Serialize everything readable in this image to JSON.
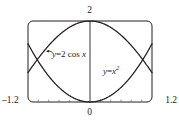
{
  "figure": {
    "name": "graphing-window-figure",
    "background_color": "#ffffff",
    "stroke_color": "#231f20",
    "frame": {
      "x_left_px": 28,
      "y_top_px": 21,
      "x_right_px": 152,
      "y_bottom_px": 102,
      "corner_radius_px": 5
    }
  },
  "labels": {
    "y_max": "2",
    "origin": "0",
    "x_min": "–1.2",
    "x_max": "1.2"
  },
  "curves": {
    "cosine": {
      "label_y": "y",
      "label_eq": "=",
      "label_coef": "2",
      "label_fn": "cos",
      "label_var": "x",
      "full_label": "y = 2 cos x",
      "color": "#231f20"
    },
    "parabola": {
      "label_y": "y",
      "label_eq": "=",
      "label_var": "x",
      "label_exp": "2",
      "full_label": "y = x²",
      "color": "#231f20"
    }
  },
  "chart_data": {
    "type": "line",
    "title": "",
    "xlabel": "",
    "ylabel": "",
    "xlim": [
      -1.2,
      1.2
    ],
    "ylim": [
      0,
      2
    ],
    "grid": false,
    "legend_position": "inline-annotations",
    "tick_labels": {
      "x": [
        "-1.2",
        "0",
        "1.2"
      ],
      "y": [
        "0",
        "2"
      ]
    },
    "annotations": [
      {
        "text": "y = 2 cos x",
        "x": -0.45,
        "y": 1.22,
        "leader_to_x": -0.83,
        "leader_to_y": 1.35
      },
      {
        "text": "y = x²",
        "x": 0.46,
        "y": 0.81
      }
    ],
    "series": [
      {
        "name": "y = 2 cos x",
        "expression": "2*cos(x)",
        "color": "#231f20",
        "x": [
          -1.2,
          -1.1,
          -1.0,
          -0.9,
          -0.8,
          -0.7,
          -0.6,
          -0.5,
          -0.4,
          -0.3,
          -0.2,
          -0.1,
          0.0,
          0.1,
          0.2,
          0.3,
          0.4,
          0.5,
          0.6,
          0.7,
          0.8,
          0.9,
          1.0,
          1.1,
          1.2
        ],
        "values": [
          0.7247,
          0.9074,
          1.0806,
          1.2432,
          1.3934,
          1.5297,
          1.6507,
          1.7552,
          1.8421,
          1.9107,
          1.9601,
          1.99,
          2.0,
          1.99,
          1.9601,
          1.9107,
          1.8421,
          1.7552,
          1.6507,
          1.5297,
          1.3934,
          1.2432,
          1.0806,
          0.9074,
          0.7247
        ]
      },
      {
        "name": "y = x²",
        "expression": "x^2",
        "color": "#231f20",
        "x": [
          -1.2,
          -1.1,
          -1.0,
          -0.9,
          -0.8,
          -0.7,
          -0.6,
          -0.5,
          -0.4,
          -0.3,
          -0.2,
          -0.1,
          0.0,
          0.1,
          0.2,
          0.3,
          0.4,
          0.5,
          0.6,
          0.7,
          0.8,
          0.9,
          1.0,
          1.1,
          1.2
        ],
        "values": [
          1.44,
          1.21,
          1.0,
          0.81,
          0.64,
          0.49,
          0.36,
          0.25,
          0.16,
          0.09,
          0.04,
          0.01,
          0.0,
          0.01,
          0.04,
          0.09,
          0.16,
          0.25,
          0.36,
          0.49,
          0.64,
          0.81,
          1.0,
          1.21,
          1.44
        ]
      }
    ],
    "intersections": [
      {
        "x": -1.0217,
        "y": 1.0439
      },
      {
        "x": 1.0217,
        "y": 1.0439
      }
    ]
  }
}
